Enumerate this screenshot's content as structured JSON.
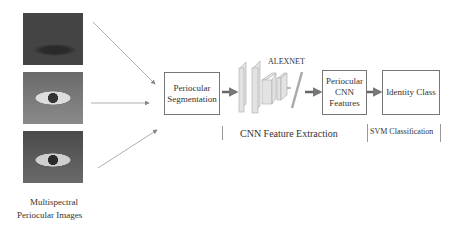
{
  "input": {
    "caption_line1": "Multispectral",
    "caption_line2": "Periocular Images",
    "images": [
      {
        "name": "periocular-image-1",
        "tone": "dark"
      },
      {
        "name": "periocular-image-2",
        "tone": "light"
      },
      {
        "name": "periocular-image-3",
        "tone": "medium"
      }
    ]
  },
  "stages": {
    "segmentation": {
      "line1": "Periocular",
      "line2": "Segmentation"
    },
    "network_label": "ALEXNET",
    "features": {
      "line1": "Periocular",
      "line2": "CNN",
      "line3": "Features"
    },
    "identity": "Identity Class"
  },
  "sections": {
    "cnn": "CNN Feature Extraction",
    "svm": "SVM Classification"
  },
  "colors": {
    "arrow": "#888888",
    "box_border": "#777777",
    "layer_fill": "#e0e0e0"
  }
}
